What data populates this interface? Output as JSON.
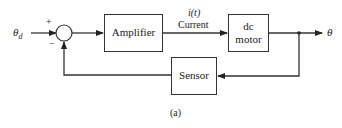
{
  "diagram": {
    "type": "block-diagram",
    "input": {
      "label": "θ",
      "subscript": "d"
    },
    "summing_junction": {
      "plus_sign": "+",
      "minus_sign": "−"
    },
    "blocks": {
      "amplifier": {
        "label": "Amplifier"
      },
      "motor": {
        "line1": "dc",
        "line2": "motor"
      },
      "sensor": {
        "label": "Sensor"
      }
    },
    "signals": {
      "current_var": "i(t)",
      "current_label": "Current",
      "output": "θ"
    },
    "caption": "(a)",
    "colors": {
      "line": "#333333",
      "background": "#ffffff"
    }
  }
}
